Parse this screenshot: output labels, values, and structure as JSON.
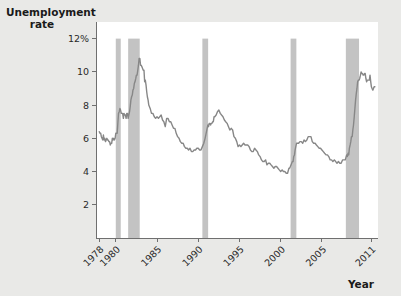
{
  "figure": {
    "background_color": "#e9e9e7",
    "plot_background_color": "#ffffff",
    "axis_color": "#6f6f6f",
    "line_color": "#878787",
    "band_color": "#c3c3c3"
  },
  "labels": {
    "y_axis_title_line1": "Unemployment",
    "y_axis_title_line2": "rate",
    "x_axis_title": "Year"
  },
  "chart_data": {
    "type": "line",
    "title": "",
    "xlabel": "Year",
    "ylabel": "Unemployment rate",
    "xlim": [
      1977.6,
      2011.8
    ],
    "ylim": [
      0,
      13.0
    ],
    "grid": false,
    "legend": "none",
    "ytick_labels": [
      "12%",
      "10",
      "8",
      "6",
      "4",
      "2"
    ],
    "ytick_values": [
      12,
      10,
      8,
      6,
      4,
      2
    ],
    "xtick_labels": [
      "1978",
      "1980",
      "1985",
      "1990",
      "1995",
      "2000",
      "2005",
      "2011"
    ],
    "xtick_values": [
      1978,
      1980,
      1985,
      1990,
      1995,
      2000,
      2005,
      2011
    ],
    "xtick_rotation": 45,
    "annotations": [
      {
        "label": "recession band",
        "x_start": 1980.0,
        "x_end": 1980.6
      },
      {
        "label": "recession band",
        "x_start": 1981.5,
        "x_end": 1982.9
      },
      {
        "label": "recession band",
        "x_start": 1990.5,
        "x_end": 1991.2
      },
      {
        "label": "recession band",
        "x_start": 2001.2,
        "x_end": 2001.9
      },
      {
        "label": "recession band",
        "x_start": 2007.9,
        "x_end": 2009.5
      }
    ],
    "series": [
      {
        "name": "Unemployment rate",
        "x": [
          1978.0,
          1978.08,
          1978.17,
          1978.25,
          1978.33,
          1978.42,
          1978.5,
          1978.58,
          1978.67,
          1978.75,
          1978.83,
          1978.92,
          1979.0,
          1979.08,
          1979.17,
          1979.25,
          1979.33,
          1979.42,
          1979.5,
          1979.58,
          1979.67,
          1979.75,
          1979.83,
          1979.92,
          1980.0,
          1980.08,
          1980.17,
          1980.25,
          1980.33,
          1980.42,
          1980.5,
          1980.58,
          1980.67,
          1980.75,
          1980.83,
          1980.92,
          1981.0,
          1981.08,
          1981.17,
          1981.25,
          1981.33,
          1981.42,
          1981.5,
          1981.58,
          1981.67,
          1981.75,
          1981.83,
          1981.92,
          1982.0,
          1982.08,
          1982.17,
          1982.25,
          1982.33,
          1982.42,
          1982.5,
          1982.58,
          1982.67,
          1982.75,
          1982.83,
          1982.92,
          1983.0,
          1983.08,
          1983.17,
          1983.25,
          1983.33,
          1983.42,
          1983.5,
          1983.58,
          1983.67,
          1983.75,
          1983.83,
          1983.92,
          1984.0,
          1984.17,
          1984.33,
          1984.5,
          1984.67,
          1984.83,
          1985.0,
          1985.17,
          1985.33,
          1985.5,
          1985.67,
          1985.83,
          1986.0,
          1986.17,
          1986.33,
          1986.5,
          1986.67,
          1986.83,
          1987.0,
          1987.17,
          1987.33,
          1987.5,
          1987.67,
          1987.83,
          1988.0,
          1988.17,
          1988.33,
          1988.5,
          1988.67,
          1988.83,
          1989.0,
          1989.17,
          1989.33,
          1989.5,
          1989.67,
          1989.83,
          1990.0,
          1990.17,
          1990.33,
          1990.5,
          1990.67,
          1990.83,
          1991.0,
          1991.08,
          1991.17,
          1991.25,
          1991.33,
          1991.42,
          1991.5,
          1991.58,
          1991.67,
          1991.75,
          1991.83,
          1991.92,
          1992.0,
          1992.17,
          1992.33,
          1992.5,
          1992.67,
          1992.83,
          1993.0,
          1993.17,
          1993.33,
          1993.5,
          1993.67,
          1993.83,
          1994.0,
          1994.17,
          1994.33,
          1994.5,
          1994.67,
          1994.83,
          1995.0,
          1995.17,
          1995.33,
          1995.5,
          1995.67,
          1995.83,
          1996.0,
          1996.17,
          1996.33,
          1996.5,
          1996.67,
          1996.83,
          1997.0,
          1997.17,
          1997.33,
          1997.5,
          1997.67,
          1997.83,
          1998.0,
          1998.17,
          1998.33,
          1998.5,
          1998.67,
          1998.83,
          1999.0,
          1999.17,
          1999.33,
          1999.5,
          1999.67,
          1999.83,
          2000.0,
          2000.17,
          2000.33,
          2000.5,
          2000.67,
          2000.83,
          2001.0,
          2001.08,
          2001.17,
          2001.25,
          2001.33,
          2001.42,
          2001.5,
          2001.58,
          2001.67,
          2001.75,
          2001.83,
          2001.92,
          2002.0,
          2002.17,
          2002.33,
          2002.5,
          2002.67,
          2002.83,
          2003.0,
          2003.17,
          2003.33,
          2003.5,
          2003.67,
          2003.83,
          2004.0,
          2004.17,
          2004.33,
          2004.5,
          2004.67,
          2004.83,
          2005.0,
          2005.17,
          2005.33,
          2005.5,
          2005.67,
          2005.83,
          2006.0,
          2006.17,
          2006.33,
          2006.5,
          2006.67,
          2006.83,
          2007.0,
          2007.17,
          2007.33,
          2007.5,
          2007.67,
          2007.83,
          2008.0,
          2008.08,
          2008.17,
          2008.25,
          2008.33,
          2008.42,
          2008.5,
          2008.58,
          2008.67,
          2008.75,
          2008.83,
          2008.92,
          2009.0,
          2009.08,
          2009.17,
          2009.25,
          2009.33,
          2009.42,
          2009.5,
          2009.58,
          2009.67,
          2009.75,
          2009.83,
          2009.92,
          2010.0,
          2010.08,
          2010.17,
          2010.25,
          2010.33,
          2010.42,
          2010.5,
          2010.58,
          2010.67,
          2010.75,
          2010.83,
          2010.92,
          2011.0,
          2011.08,
          2011.17,
          2011.25,
          2011.33,
          2011.42
        ],
        "values": [
          6.4,
          6.3,
          6.3,
          6.1,
          6.0,
          5.9,
          6.2,
          5.9,
          6.0,
          5.8,
          5.9,
          6.0,
          5.9,
          5.9,
          5.8,
          5.8,
          5.6,
          5.7,
          5.7,
          6.0,
          5.9,
          6.0,
          5.9,
          6.0,
          6.3,
          6.3,
          6.3,
          6.9,
          7.5,
          7.6,
          7.8,
          7.7,
          7.5,
          7.5,
          7.5,
          7.2,
          7.5,
          7.4,
          7.4,
          7.2,
          7.5,
          7.5,
          7.2,
          7.4,
          7.6,
          7.9,
          8.3,
          8.5,
          8.6,
          8.9,
          9.0,
          9.3,
          9.4,
          9.6,
          9.8,
          9.8,
          10.1,
          10.4,
          10.8,
          10.8,
          10.4,
          10.4,
          10.3,
          10.2,
          10.1,
          10.1,
          9.4,
          9.5,
          9.2,
          8.8,
          8.5,
          8.3,
          8.0,
          7.8,
          7.5,
          7.5,
          7.3,
          7.2,
          7.3,
          7.2,
          7.3,
          7.4,
          7.1,
          7.0,
          6.7,
          7.2,
          7.2,
          7.0,
          7.0,
          6.8,
          6.6,
          6.6,
          6.3,
          6.1,
          6.0,
          5.8,
          5.7,
          5.7,
          5.5,
          5.4,
          5.4,
          5.3,
          5.4,
          5.2,
          5.2,
          5.3,
          5.3,
          5.4,
          5.4,
          5.3,
          5.3,
          5.5,
          5.7,
          6.0,
          6.4,
          6.6,
          6.8,
          6.7,
          6.9,
          6.9,
          6.8,
          6.9,
          6.9,
          7.0,
          7.0,
          7.3,
          7.3,
          7.4,
          7.6,
          7.7,
          7.5,
          7.4,
          7.3,
          7.1,
          7.0,
          6.9,
          6.7,
          6.5,
          6.6,
          6.5,
          6.1,
          6.0,
          5.8,
          5.5,
          5.6,
          5.5,
          5.6,
          5.7,
          5.6,
          5.6,
          5.6,
          5.5,
          5.3,
          5.2,
          5.2,
          5.4,
          5.3,
          5.2,
          5.0,
          4.9,
          4.7,
          4.6,
          4.6,
          4.7,
          4.4,
          4.5,
          4.5,
          4.4,
          4.3,
          4.2,
          4.3,
          4.3,
          4.2,
          4.1,
          4.0,
          4.1,
          4.0,
          4.0,
          3.9,
          3.9,
          4.2,
          4.2,
          4.3,
          4.4,
          4.5,
          4.6,
          4.6,
          4.9,
          5.0,
          5.3,
          5.5,
          5.7,
          5.7,
          5.7,
          5.8,
          5.8,
          5.7,
          5.9,
          5.8,
          5.9,
          6.1,
          6.1,
          6.1,
          5.8,
          5.7,
          5.7,
          5.6,
          5.5,
          5.4,
          5.4,
          5.3,
          5.2,
          5.1,
          5.0,
          5.0,
          4.9,
          4.7,
          4.7,
          4.6,
          4.7,
          4.6,
          4.5,
          4.6,
          4.5,
          4.5,
          4.7,
          4.7,
          4.7,
          5.0,
          4.9,
          5.1,
          5.0,
          5.4,
          5.6,
          5.8,
          6.1,
          6.1,
          6.5,
          6.8,
          7.3,
          7.8,
          8.3,
          8.7,
          9.0,
          9.4,
          9.5,
          9.5,
          9.6,
          9.8,
          10.0,
          9.9,
          9.9,
          9.8,
          9.8,
          9.9,
          9.9,
          9.6,
          9.4,
          9.5,
          9.5,
          9.5,
          9.5,
          9.8,
          9.4,
          9.1,
          9.0,
          8.9,
          9.0,
          9.1,
          9.1
        ]
      }
    ]
  }
}
